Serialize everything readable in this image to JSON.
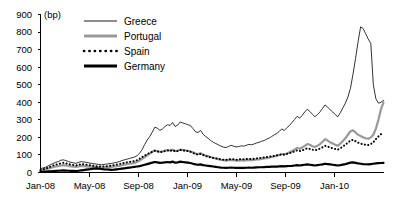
{
  "chart_data": {
    "type": "line",
    "title": "",
    "subtitle": "",
    "xlabel": "",
    "ylabel": "(bp)",
    "unit_label": "(bp)",
    "ylim": [
      0,
      900
    ],
    "ytick_labels": [
      "0",
      "100",
      "200",
      "300",
      "400",
      "500",
      "600",
      "700",
      "800",
      "900"
    ],
    "ytick_values": [
      0,
      100,
      200,
      300,
      400,
      500,
      600,
      700,
      800,
      900
    ],
    "xtick_labels": [
      "Jan-08",
      "May-08",
      "Sep-08",
      "Jan-09",
      "May-09",
      "Sep-09",
      "Jan-10"
    ],
    "xtick_values": [
      0,
      4,
      8,
      12,
      16,
      20,
      24
    ],
    "xlim": [
      0,
      28
    ],
    "grid": false,
    "legend_position": "top-left-inside",
    "legend": [
      "Greece",
      "Portugal",
      "Spain",
      "Germany"
    ],
    "series": [
      {
        "name": "Greece",
        "color": "#000000",
        "style": "thin-solid",
        "values": [
          22,
          26,
          30,
          38,
          45,
          52,
          58,
          62,
          70,
          72,
          68,
          62,
          58,
          55,
          52,
          58,
          62,
          60,
          58,
          55,
          52,
          50,
          48,
          46,
          44,
          46,
          48,
          50,
          52,
          55,
          58,
          62,
          68,
          72,
          76,
          80,
          84,
          88,
          95,
          110,
          130,
          160,
          185,
          205,
          230,
          258,
          252,
          240,
          248,
          262,
          272,
          268,
          285,
          262,
          270,
          288,
          282,
          278,
          272,
          268,
          250,
          232,
          228,
          240,
          218,
          205,
          195,
          182,
          172,
          165,
          158,
          150,
          145,
          142,
          148,
          155,
          150,
          145,
          148,
          152,
          150,
          155,
          160,
          158,
          162,
          168,
          172,
          178,
          182,
          190,
          196,
          205,
          215,
          222,
          235,
          248,
          240,
          255,
          268,
          285,
          302,
          320,
          310,
          325,
          345,
          360,
          348,
          332,
          318,
          330,
          345,
          365,
          385,
          372,
          358,
          345,
          330,
          318,
          340,
          368,
          395,
          430,
          480,
          560,
          650,
          745,
          830,
          820,
          790,
          760,
          735,
          500,
          420,
          395,
          400,
          410
        ]
      },
      {
        "name": "Portugal",
        "color": "#999999",
        "style": "thick-solid",
        "values": [
          12,
          15,
          18,
          22,
          26,
          30,
          34,
          36,
          40,
          42,
          40,
          38,
          35,
          33,
          32,
          35,
          38,
          36,
          35,
          33,
          32,
          30,
          29,
          28,
          27,
          28,
          29,
          30,
          32,
          34,
          36,
          38,
          42,
          45,
          48,
          50,
          52,
          55,
          60,
          68,
          78,
          88,
          98,
          108,
          118,
          125,
          122,
          118,
          120,
          125,
          128,
          125,
          130,
          122,
          125,
          130,
          128,
          126,
          124,
          120,
          115,
          108,
          105,
          110,
          102,
          96,
          92,
          88,
          84,
          80,
          76,
          72,
          70,
          68,
          70,
          72,
          70,
          68,
          68,
          70,
          68,
          70,
          72,
          70,
          72,
          74,
          75,
          78,
          80,
          82,
          84,
          88,
          92,
          95,
          100,
          105,
          102,
          108,
          115,
          122,
          130,
          140,
          135,
          142,
          152,
          162,
          158,
          150,
          145,
          152,
          162,
          175,
          190,
          182,
          172,
          165,
          158,
          152,
          165,
          180,
          195,
          215,
          235,
          240,
          228,
          215,
          208,
          200,
          195,
          192,
          200,
          215,
          250,
          300,
          360,
          400
        ]
      },
      {
        "name": "Spain",
        "color": "#000000",
        "style": "dotted",
        "values": [
          14,
          18,
          22,
          28,
          34,
          40,
          45,
          48,
          52,
          55,
          52,
          48,
          45,
          42,
          40,
          44,
          48,
          46,
          44,
          42,
          40,
          38,
          36,
          35,
          34,
          35,
          36,
          38,
          40,
          42,
          45,
          48,
          52,
          55,
          58,
          60,
          62,
          65,
          70,
          78,
          88,
          96,
          104,
          112,
          118,
          124,
          120,
          116,
          118,
          122,
          126,
          122,
          128,
          120,
          122,
          128,
          126,
          124,
          122,
          118,
          112,
          105,
          102,
          106,
          100,
          94,
          90,
          86,
          82,
          80,
          78,
          75,
          73,
          72,
          74,
          76,
          75,
          73,
          74,
          76,
          75,
          76,
          78,
          76,
          78,
          80,
          82,
          84,
          86,
          88,
          90,
          92,
          95,
          98,
          100,
          104,
          102,
          106,
          110,
          115,
          120,
          126,
          122,
          126,
          132,
          138,
          134,
          130,
          126,
          130,
          136,
          144,
          152,
          148,
          142,
          138,
          134,
          130,
          138,
          148,
          158,
          170,
          182,
          186,
          178,
          170,
          165,
          160,
          158,
          156,
          162,
          172,
          190,
          205,
          218,
          230
        ]
      },
      {
        "name": "Germany",
        "color": "#000000",
        "style": "thick-solid",
        "values": [
          3,
          4,
          5,
          6,
          7,
          8,
          9,
          10,
          11,
          12,
          11,
          10,
          9,
          9,
          8,
          10,
          12,
          14,
          16,
          18,
          20,
          22,
          24,
          22,
          20,
          18,
          17,
          16,
          15,
          16,
          18,
          20,
          22,
          24,
          26,
          28,
          30,
          32,
          34,
          36,
          40,
          44,
          48,
          52,
          56,
          60,
          58,
          55,
          56,
          58,
          60,
          58,
          62,
          56,
          58,
          62,
          60,
          58,
          56,
          54,
          50,
          46,
          44,
          46,
          42,
          40,
          38,
          36,
          34,
          32,
          30,
          28,
          27,
          26,
          27,
          28,
          27,
          26,
          26,
          27,
          26,
          27,
          28,
          27,
          28,
          29,
          30,
          30,
          31,
          32,
          32,
          33,
          34,
          34,
          35,
          36,
          35,
          36,
          37,
          38,
          40,
          42,
          40,
          42,
          44,
          46,
          44,
          42,
          40,
          42,
          44,
          46,
          50,
          48,
          46,
          44,
          42,
          40,
          42,
          45,
          48,
          52,
          56,
          58,
          55,
          52,
          50,
          48,
          47,
          46,
          48,
          50,
          52,
          53,
          54,
          55
        ]
      }
    ]
  }
}
